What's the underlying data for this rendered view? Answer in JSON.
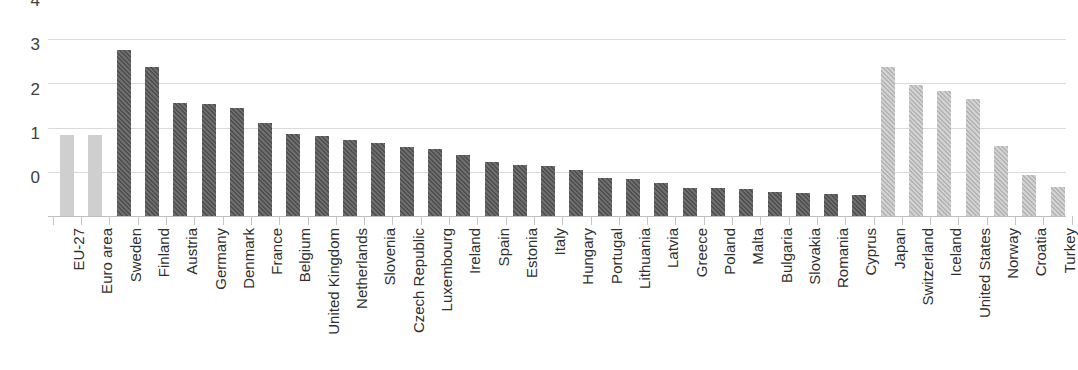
{
  "chart_data": {
    "type": "bar",
    "title": "",
    "subtitle": "",
    "xlabel": "",
    "ylabel": "",
    "ylim": [
      0,
      4
    ],
    "yticks": [
      0,
      1,
      2,
      3,
      4
    ],
    "ytick_labels": [
      "0",
      "1",
      "2",
      "3",
      "4"
    ],
    "grid": true,
    "legend": "none",
    "categories": [
      "EU-27",
      "Euro area",
      "Sweden",
      "Finland",
      "Austria",
      "Germany",
      "Denmark",
      "France",
      "Belgium",
      "United Kingdom",
      "Netherlands",
      "Slovenia",
      "Czech Republic",
      "Luxembourg",
      "Ireland",
      "Spain",
      "Estonia",
      "Italy",
      "Hungary",
      "Portugal",
      "Lithuania",
      "Latvia",
      "Greece",
      "Poland",
      "Malta",
      "Bulgaria",
      "Slovakia",
      "Romania",
      "Cyprus",
      "Japan",
      "Switzerland",
      "Iceland",
      "United States",
      "Norway",
      "Croatia",
      "Turkey"
    ],
    "values": [
      1.83,
      1.84,
      3.75,
      3.37,
      2.56,
      2.54,
      2.45,
      2.11,
      1.85,
      1.81,
      1.71,
      1.64,
      1.57,
      1.51,
      1.38,
      1.22,
      1.16,
      1.13,
      1.03,
      0.87,
      0.84,
      0.75,
      0.64,
      0.63,
      0.61,
      0.55,
      0.52,
      0.5,
      0.47,
      3.36,
      2.95,
      2.83,
      2.65,
      1.58,
      0.93,
      0.65
    ],
    "styles": [
      "solid-light",
      "solid-light",
      "hatch-dark",
      "hatch-dark",
      "hatch-dark",
      "hatch-dark",
      "hatch-dark",
      "hatch-dark",
      "hatch-dark",
      "hatch-dark",
      "hatch-dark",
      "hatch-dark",
      "hatch-dark",
      "hatch-dark",
      "hatch-dark",
      "hatch-dark",
      "hatch-dark",
      "hatch-dark",
      "hatch-dark",
      "hatch-dark",
      "hatch-dark",
      "hatch-dark",
      "hatch-dark",
      "hatch-dark",
      "hatch-dark",
      "hatch-dark",
      "hatch-dark",
      "hatch-dark",
      "hatch-dark",
      "hatch-light",
      "hatch-light",
      "hatch-light",
      "hatch-light",
      "hatch-light",
      "hatch-light",
      "hatch-light"
    ],
    "colors": {
      "aggregate_bar": "#cfcfcf",
      "eu_member_bar": "#5e5e5e",
      "non_eu_bar": "#c3c3c3",
      "gridline": "#d9d9d9",
      "axis_text": "#404040"
    }
  }
}
